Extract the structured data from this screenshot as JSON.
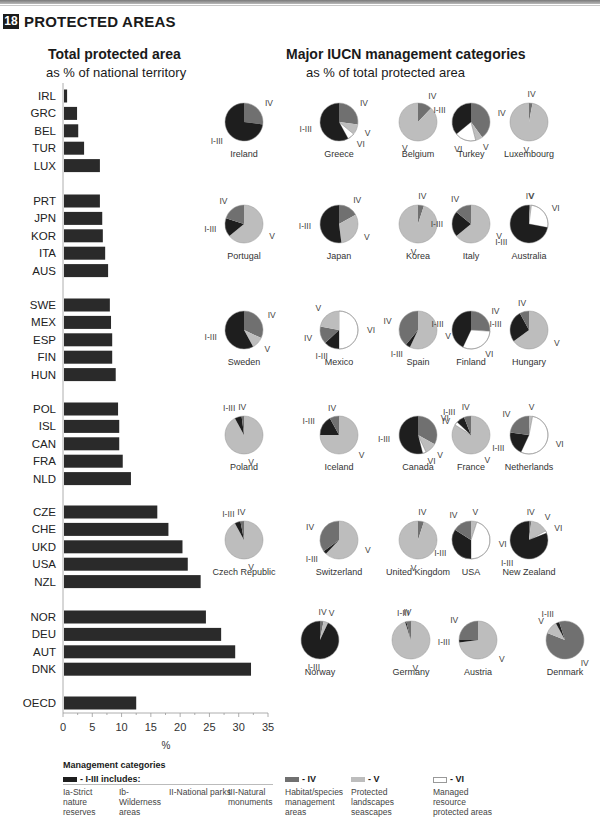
{
  "section": {
    "number": "18",
    "title": "PROTECTED AREAS"
  },
  "left_panel": {
    "title": "Total protected area",
    "subtitle": "as % of national territory"
  },
  "right_panel": {
    "title": "Major IUCN management categories",
    "subtitle": "as % of total protected area"
  },
  "colors": {
    "I-III": "#1e1e1e",
    "IV": "#707070",
    "V": "#bdbdbd",
    "VI": "#ffffff",
    "bar": "#2a2a2a"
  },
  "chart_data": [
    {
      "type": "bar",
      "orientation": "horizontal",
      "title": "Total protected area",
      "subtitle": "as % of national territory",
      "xlabel": "%",
      "xlim": [
        0,
        35
      ],
      "xticks": [
        0,
        5,
        10,
        15,
        20,
        25,
        30,
        35
      ],
      "groups": [
        {
          "categories": [
            "IRL",
            "GRC",
            "BEL",
            "TUR",
            "LUX"
          ],
          "values": [
            0.7,
            2.4,
            2.6,
            3.6,
            6.3
          ]
        },
        {
          "categories": [
            "PRT",
            "JPN",
            "KOR",
            "ITA",
            "AUS"
          ],
          "values": [
            6.3,
            6.7,
            6.8,
            7.2,
            7.7
          ]
        },
        {
          "categories": [
            "SWE",
            "MEX",
            "ESP",
            "FIN",
            "HUN"
          ],
          "values": [
            8.0,
            8.2,
            8.4,
            8.4,
            9.0
          ]
        },
        {
          "categories": [
            "POL",
            "ISL",
            "CAN",
            "FRA",
            "NLD"
          ],
          "values": [
            9.4,
            9.6,
            9.6,
            10.2,
            11.6
          ]
        },
        {
          "categories": [
            "CZE",
            "CHE",
            "UKD",
            "USA",
            "NZL"
          ],
          "values": [
            16.1,
            18.0,
            20.4,
            21.3,
            23.5
          ]
        },
        {
          "categories": [
            "NOR",
            "DEU",
            "AUT",
            "DNK"
          ],
          "values": [
            24.4,
            27.0,
            29.4,
            32.1
          ]
        },
        {
          "categories": [
            "OECD"
          ],
          "values": [
            12.5
          ]
        }
      ]
    },
    {
      "type": "pie",
      "title": "Major IUCN management categories",
      "subtitle": "as % of total protected area",
      "pies": [
        {
          "name": "Ireland",
          "slices": [
            [
              "IV",
              27
            ],
            [
              "I-III",
              73
            ]
          ]
        },
        {
          "name": "Greece",
          "slices": [
            [
              "IV",
              27
            ],
            [
              "V",
              9
            ],
            [
              "VI",
              6
            ],
            [
              "I-III",
              58
            ]
          ]
        },
        {
          "name": "Belgium",
          "slices": [
            [
              "IV",
              12
            ],
            [
              "V",
              88
            ]
          ]
        },
        {
          "name": "Turkey",
          "slices": [
            [
              "IV",
              40
            ],
            [
              "V",
              6
            ],
            [
              "VI",
              18
            ],
            [
              "I-III",
              36
            ]
          ]
        },
        {
          "name": "Luxembourg",
          "slices": [
            [
              "IV",
              3
            ],
            [
              "V",
              97
            ]
          ]
        },
        {
          "name": "Portugal",
          "slices": [
            [
              "V",
              64
            ],
            [
              "I-III",
              16
            ],
            [
              "IV",
              20
            ]
          ]
        },
        {
          "name": "Japan",
          "slices": [
            [
              "IV",
              17
            ],
            [
              "V",
              31
            ],
            [
              "I-III",
              52
            ]
          ]
        },
        {
          "name": "Korea",
          "slices": [
            [
              "IV",
              5
            ],
            [
              "V",
              95
            ]
          ]
        },
        {
          "name": "Italy",
          "slices": [
            [
              "V",
              64
            ],
            [
              "I-III",
              22
            ],
            [
              "IV",
              14
            ]
          ]
        },
        {
          "name": "Australia",
          "slices": [
            [
              "IV",
              1
            ],
            [
              "V",
              1
            ],
            [
              "VI",
              26
            ],
            [
              "I-III",
              72
            ]
          ]
        },
        {
          "name": "Sweden",
          "slices": [
            [
              "IV",
              32
            ],
            [
              "V",
              10
            ],
            [
              "I-III",
              58
            ]
          ]
        },
        {
          "name": "Mexico",
          "slices": [
            [
              "VI",
              50
            ],
            [
              "I-III",
              13
            ],
            [
              "IV",
              15
            ],
            [
              "V",
              22
            ]
          ]
        },
        {
          "name": "Spain",
          "slices": [
            [
              "V",
              57
            ],
            [
              "I-III",
              4
            ],
            [
              "IV",
              39
            ]
          ]
        },
        {
          "name": "Finland",
          "slices": [
            [
              "IV",
              26
            ],
            [
              "VI",
              31
            ],
            [
              "I-III",
              43
            ]
          ]
        },
        {
          "name": "Hungary",
          "slices": [
            [
              "V",
              65
            ],
            [
              "I-III",
              27
            ],
            [
              "IV",
              8
            ]
          ]
        },
        {
          "name": "Poland",
          "slices": [
            [
              "V",
              92
            ],
            [
              "I-III",
              6
            ],
            [
              "IV",
              2
            ]
          ]
        },
        {
          "name": "Iceland",
          "slices": [
            [
              "V",
              75
            ],
            [
              "I-III",
              17
            ],
            [
              "IV",
              8
            ]
          ]
        },
        {
          "name": "Canada",
          "slices": [
            [
              "IV",
              33
            ],
            [
              "V",
              10
            ],
            [
              "VI",
              3
            ],
            [
              "I-III",
              54
            ]
          ]
        },
        {
          "name": "France",
          "slices": [
            [
              "V",
              84
            ],
            [
              "VI",
              3
            ],
            [
              "I-III",
              7
            ],
            [
              "IV",
              6
            ]
          ]
        },
        {
          "name": "Netherlands",
          "slices": [
            [
              "V",
              3
            ],
            [
              "VI",
              54
            ],
            [
              "I-III",
              20
            ],
            [
              "IV",
              23
            ]
          ]
        },
        {
          "name": "Czech Republic",
          "slices": [
            [
              "V",
              92
            ],
            [
              "I-III",
              5
            ],
            [
              "IV",
              3
            ]
          ]
        },
        {
          "name": "Switzerland",
          "slices": [
            [
              "V",
              62
            ],
            [
              "I-III",
              3
            ],
            [
              "IV",
              35
            ]
          ]
        },
        {
          "name": "United Kingdom",
          "slices": [
            [
              "IV",
              5
            ],
            [
              "V",
              95
            ]
          ]
        },
        {
          "name": "USA",
          "slices": [
            [
              "V",
              5
            ],
            [
              "VI",
              45
            ],
            [
              "I-III",
              34
            ],
            [
              "IV",
              16
            ]
          ]
        },
        {
          "name": "New Zealand",
          "slices": [
            [
              "IV",
              2
            ],
            [
              "V",
              15
            ],
            [
              "VI",
              2
            ],
            [
              "I-III",
              81
            ]
          ]
        },
        {
          "name": "Norway",
          "slices": [
            [
              "IV",
              3
            ],
            [
              "V",
              4
            ],
            [
              "I-III",
              93
            ]
          ]
        },
        {
          "name": "Germany",
          "slices": [
            [
              "V",
              95
            ],
            [
              "I-III",
              1
            ],
            [
              "IV",
              4
            ]
          ]
        },
        {
          "name": "Austria",
          "slices": [
            [
              "V",
              73
            ],
            [
              "I-III",
              2
            ],
            [
              "IV",
              25
            ]
          ]
        },
        {
          "name": "Denmark",
          "slices": [
            [
              "IV",
              81
            ],
            [
              "V",
              11
            ],
            [
              "I-III",
              3
            ],
            [
              "IV2",
              5
            ]
          ]
        }
      ]
    }
  ],
  "legend": {
    "title": "Management categories",
    "items": [
      {
        "key": "I-III",
        "label": "- I-III includes:"
      },
      {
        "key": "IV",
        "label": "- IV",
        "desc": "Habitat/species management areas"
      },
      {
        "key": "V",
        "label": "- V",
        "desc": "Protected landscapes seascapes"
      },
      {
        "key": "VI",
        "label": "- VI",
        "desc": "Managed resource protected areas"
      }
    ],
    "sub_items": [
      "Ia-Strict nature reserves",
      "Ib-Wilderness areas",
      "II-National parks",
      "III-Natural monuments"
    ]
  }
}
